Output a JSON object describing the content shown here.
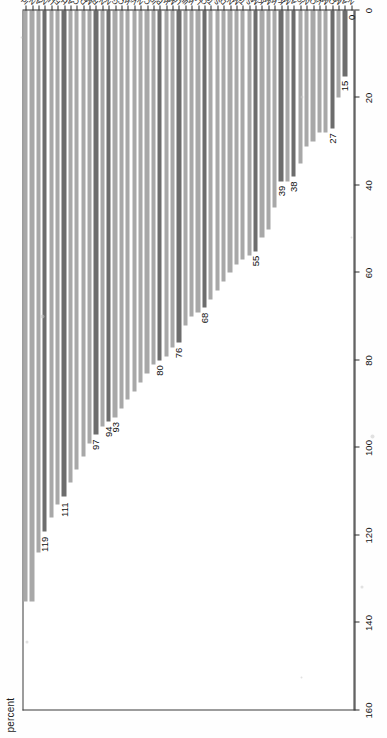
{
  "chart": {
    "type": "bar",
    "title": "",
    "orientation": "vertical-rotated",
    "xlabel": "",
    "ylabel": "percent",
    "axis_title": "percent",
    "ylim": [
      0,
      160
    ],
    "ytick_step": 20,
    "yticks": [
      "0",
      "20",
      "40",
      "60",
      "80",
      "100",
      "120",
      "140",
      "160"
    ],
    "grid": false,
    "legend": "none",
    "colors": {
      "bar": "#a8a8a8",
      "bar_highlight": "#6d6d6d",
      "axis": "#2b2b2b",
      "text": "#111111",
      "background": "#ffffff"
    }
  },
  "chart_data": {
    "type": "bar",
    "title": "",
    "xlabel": "",
    "ylabel": "percent",
    "ylim": [
      0,
      160
    ],
    "grid": false,
    "legend_position": "none",
    "axis_ticks": [
      0,
      20,
      40,
      60,
      80,
      100,
      120,
      140,
      160
    ],
    "categories": [
      "Idaho",
      "Nevada",
      "Arizona",
      "New Jersey",
      "Utah",
      "Florida",
      "Hawaii",
      "Alabama",
      "Colorado",
      "Delaware",
      "Maryland",
      "Rhode Island",
      "North Carolina",
      "New Mexico",
      "Georgia",
      "California",
      "Wyoming",
      "Virginia",
      "New York",
      "Connecticut",
      "Indiana",
      "Pennsylvania",
      "Washington",
      "Montana",
      "US average",
      "Illinois",
      "West Virginia",
      "Louisiana",
      "Oregon",
      "Tennessee",
      "South Carolina",
      "District of Columbia",
      "New Hampshire",
      "Maine",
      "Texas",
      "South Dakota",
      "Massachusetts",
      "Kentucky",
      "Mississippi",
      "Wisconsin",
      "Kansas",
      "Missouri",
      "Arkansas",
      "Iowa",
      "Nebraska",
      "Ohio",
      "Vermont",
      "Michigan",
      "Oklahoma",
      "Minnesota",
      "Alaska",
      "North Dakota"
    ],
    "values": [
      135,
      135,
      124,
      119,
      116,
      113,
      111,
      108,
      105,
      102,
      99,
      97,
      95,
      94,
      93,
      91,
      89,
      87,
      85,
      83,
      81,
      80,
      79,
      77,
      76,
      72,
      70,
      69,
      68,
      66,
      64,
      62,
      60,
      58,
      57,
      56,
      55,
      52,
      50,
      45,
      39,
      39,
      38,
      35,
      31,
      30,
      28,
      28,
      27,
      20,
      15,
      0
    ],
    "highlighted_categories": [
      "New Jersey",
      "Hawaii",
      "Rhode Island",
      "New Mexico",
      "Pennsylvania",
      "US average",
      "Oregon",
      "Massachusetts",
      "Kansas",
      "Arkansas",
      "Oklahoma",
      "Alaska"
    ],
    "labeled_points": [
      {
        "category": "New Jersey",
        "value": 119,
        "label": "119"
      },
      {
        "category": "Hawaii",
        "value": 111,
        "label": "111"
      },
      {
        "category": "Rhode Island",
        "value": 97,
        "label": "97"
      },
      {
        "category": "New Mexico",
        "value": 94,
        "label": "94"
      },
      {
        "category": "Georgia",
        "value": 93,
        "label": "93"
      },
      {
        "category": "Pennsylvania",
        "value": 80,
        "label": "80"
      },
      {
        "category": "US average",
        "value": 76,
        "label": "76"
      },
      {
        "category": "Oregon",
        "value": 68,
        "label": "68"
      },
      {
        "category": "Massachusetts",
        "value": 55,
        "label": "55"
      },
      {
        "category": "Kansas",
        "value": 39,
        "label": "39"
      },
      {
        "category": "Arkansas",
        "value": 38,
        "label": "38"
      },
      {
        "category": "Oklahoma",
        "value": 27,
        "label": "27"
      },
      {
        "category": "Alaska",
        "value": 15,
        "label": "15"
      },
      {
        "category": "North Dakota",
        "value": 0,
        "label": "0"
      }
    ]
  }
}
